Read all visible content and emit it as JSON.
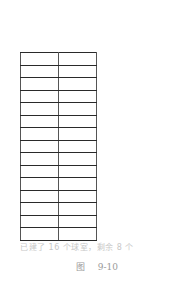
{
  "figure": {
    "table": {
      "rows": 15,
      "columns": 2,
      "cells": [
        [
          "",
          ""
        ],
        [
          "",
          ""
        ],
        [
          "",
          ""
        ],
        [
          "",
          ""
        ],
        [
          "",
          ""
        ],
        [
          "",
          ""
        ],
        [
          "",
          ""
        ],
        [
          "",
          ""
        ],
        [
          "",
          ""
        ],
        [
          "",
          ""
        ],
        [
          "",
          ""
        ],
        [
          "",
          ""
        ],
        [
          "",
          ""
        ],
        [
          "",
          ""
        ],
        [
          "",
          ""
        ]
      ]
    },
    "note": "已建了 16 个球室，剩余 8 个",
    "caption": {
      "label": "图",
      "number": "9-10"
    }
  },
  "colors": {
    "grid_line": "#2a2a2a",
    "note_text": "#c8c8c8",
    "caption_text": "#9a9a9a",
    "background": "#ffffff"
  }
}
